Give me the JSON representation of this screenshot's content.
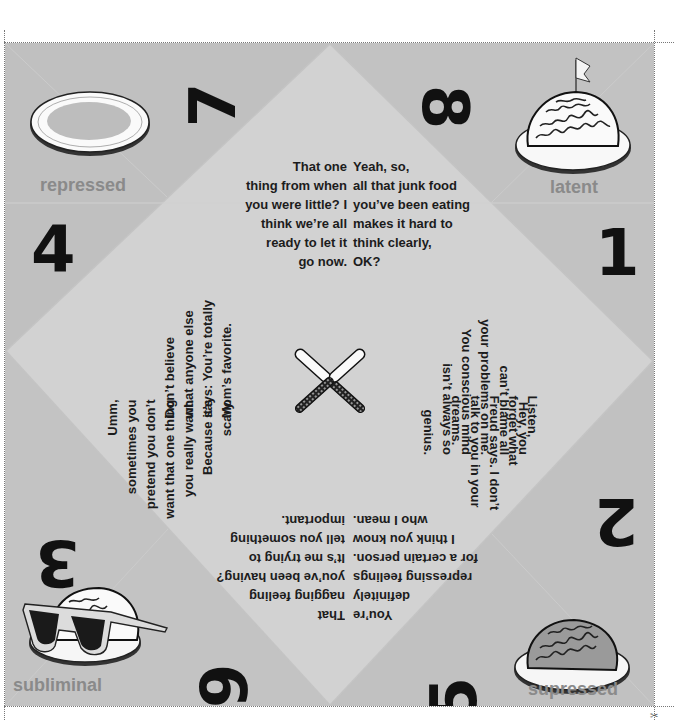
{
  "fortune_teller": {
    "corners": {
      "top_left": {
        "label": "repressed",
        "icon": "empty-plate-icon"
      },
      "top_right": {
        "label": "latent",
        "icon": "brain-with-flag-icon"
      },
      "bottom_left": {
        "label": "subliminal",
        "icon": "brain-with-sunglasses-icon"
      },
      "bottom_right": {
        "label": "supressed",
        "icon": "brain-on-plate-icon"
      }
    },
    "numbers": {
      "n1": "1",
      "n2": "2",
      "n3": "3",
      "n4": "4",
      "n5": "5",
      "n6": "6",
      "n7": "7",
      "n8": "8"
    },
    "messages": {
      "m7": "That one\nthing from when\nyou were little? I\nthink we’re all\nready to let it\ngo now.",
      "m8": "Yeah, so,\nall that junk food\nyou’ve been eating\nmakes it hard to\nthink clearly,\nOK?",
      "m1": "Hey, you\ncan’t blame all\nyour problems on me.\nYou conscious mind\nisn’t always so\ngenius.",
      "m2": "Listen,\nforget what\nFreud says. I don’t\ntalk to you in your\ndreams.",
      "m5": "You’re\ndefinitely\nrepressing feelings\nfor a certain person.\nI think you know\nwho I mean.",
      "m6": "That\nnagging feeling\nyou’ve been having?\nIt’s me trying to\ntell you something\nimportant.",
      "m3": "Umm,\nsometimes you\npretend you don’t\nwant that one thing\nyou really want.\nBecause it’s\nscary.",
      "m4": "Don’t believe\nwhat anyone else\nsays: You’re totally\nMom’s favorite."
    },
    "center_icon": "crossed-knives-icon",
    "colors": {
      "sheet": "#c4c4c4",
      "diamond": "#d2d2d2",
      "label": "#8a8a8a",
      "text": "#1c1c1c"
    }
  }
}
